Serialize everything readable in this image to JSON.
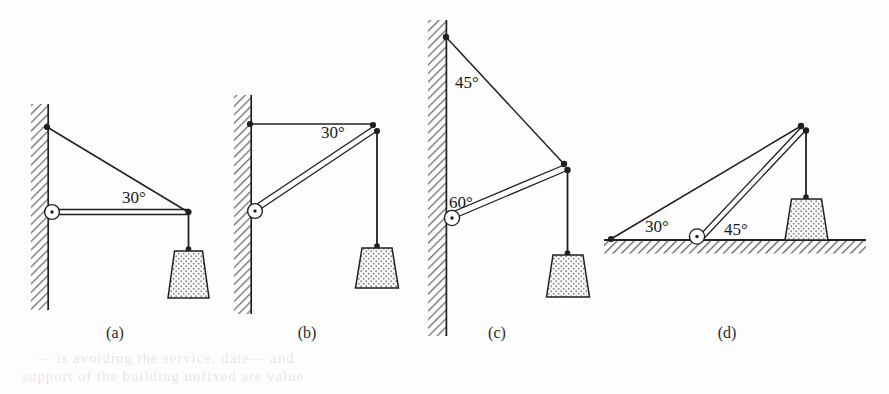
{
  "figure": {
    "background_color": "#fdfdfd",
    "ink_color": "#231f20",
    "hatch_color": "#6d6d72",
    "stipple_color": "#8a8a8f",
    "panels": [
      {
        "id": "a",
        "caption": "(a)",
        "caption_x": 115,
        "caption_y": 338,
        "support_type": "vertical-wall",
        "angles": [
          {
            "value": "30°",
            "x": 122,
            "y": 203,
            "at": "tie-to-strut joint"
          }
        ],
        "members": [
          {
            "name": "tie-rod",
            "style": "single-line"
          },
          {
            "name": "horizontal-strut",
            "style": "double-line"
          },
          {
            "name": "hanger-rope",
            "style": "single-line"
          }
        ],
        "has_pivot": true,
        "has_weight": true
      },
      {
        "id": "b",
        "caption": "(b)",
        "caption_x": 307,
        "caption_y": 338,
        "support_type": "vertical-wall",
        "angles": [
          {
            "value": "30°",
            "x": 321,
            "y": 138,
            "at": "horizontal-tie to inclined-strut"
          }
        ],
        "members": [
          {
            "name": "horizontal-tie",
            "style": "single-line"
          },
          {
            "name": "inclined-strut",
            "style": "double-line"
          },
          {
            "name": "hanger-rope",
            "style": "single-line"
          }
        ],
        "has_pivot": true,
        "has_weight": true
      },
      {
        "id": "c",
        "caption": "(c)",
        "caption_x": 497,
        "caption_y": 338,
        "support_type": "vertical-wall",
        "angles": [
          {
            "value": "45°",
            "x": 455,
            "y": 88,
            "at": "wall to tie-rod at upper anchor"
          },
          {
            "value": "60°",
            "x": 449,
            "y": 208,
            "at": "wall to strut at pivot"
          }
        ],
        "members": [
          {
            "name": "tie-rod",
            "style": "single-line"
          },
          {
            "name": "inclined-strut",
            "style": "double-line"
          },
          {
            "name": "hanger-rope",
            "style": "single-line"
          }
        ],
        "has_pivot": true,
        "has_weight": true
      },
      {
        "id": "d",
        "caption": "(d)",
        "caption_x": 727,
        "caption_y": 338,
        "support_type": "horizontal-ground",
        "angles": [
          {
            "value": "30°",
            "x": 645,
            "y": 227,
            "at": "ground to tie-rod"
          },
          {
            "value": "45°",
            "x": 724,
            "y": 232,
            "at": "ground to strut at pivot"
          }
        ],
        "members": [
          {
            "name": "tie-rod",
            "style": "single-line"
          },
          {
            "name": "inclined-strut",
            "style": "double-line"
          },
          {
            "name": "hanger-rope",
            "style": "single-line"
          }
        ],
        "has_pivot": true,
        "has_weight": true
      }
    ]
  },
  "bleed_through": [
    {
      "text": "— is avoiding the service, date— and",
      "x": 36,
      "y": 356
    },
    {
      "text": "support of the building unfixed are value",
      "x": 22,
      "y": 372
    }
  ]
}
